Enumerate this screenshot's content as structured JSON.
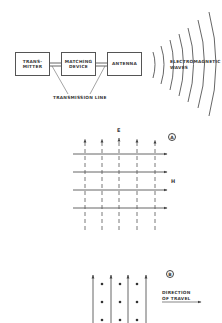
{
  "block_diagram": {
    "blocks": [
      {
        "id": "transmitter",
        "label": "TRANS-\nMITTER"
      },
      {
        "id": "matching-device",
        "label": "MATCHING\nDEVICE"
      },
      {
        "id": "antenna",
        "label": "ANTENNA"
      }
    ],
    "transmission_line_label": "TRANSMISSION LINE",
    "waves_label_line1": "ELECTROMAGNETIC",
    "waves_label_line2": "WAVES"
  },
  "panel_a": {
    "marker": "A",
    "e_label": "E",
    "h_label": "H",
    "e_field_lines": 5,
    "h_field_arrows": 4
  },
  "panel_b": {
    "marker": "B",
    "direction_label_line1": "DIRECTION",
    "direction_label_line2": "OF TRAVEL",
    "e_field_arrows": 4,
    "h_field_dot_columns": 3,
    "h_field_dot_rows": 3
  },
  "colors": {
    "line": "#555555",
    "text": "#3a3a3a",
    "background": "#ffffff"
  }
}
